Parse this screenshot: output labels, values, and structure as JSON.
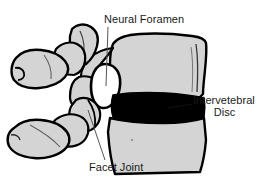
{
  "figure": {
    "background_color": "#ffffff",
    "bone_fill_color": "#d4d4d4",
    "bone_outline_color": "#000000",
    "disc_color": "#000000",
    "foramen_color": "#ffffff",
    "label_color": "#1a1a1a",
    "leader_line_color": "#555555"
  },
  "labels": {
    "neural_foramen": {
      "text": "Neural Foramen",
      "leader": "vertical-down"
    },
    "intervertebral_disc": {
      "line1": "Intervetebral",
      "line2": "Disc",
      "leader": "horizontal-left"
    },
    "facet_joint": {
      "text": "Facet Joint",
      "leader": "diagonal-up-left"
    }
  }
}
